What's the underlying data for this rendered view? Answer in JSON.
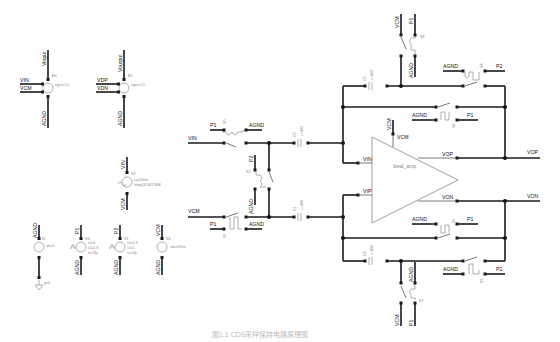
{
  "caption": "图1.1  CDS采样保持电路原理图",
  "sources": {
    "e0": {
      "name": "E0",
      "param": "egain:1.0",
      "top": "Vinput",
      "in_p": "VIN",
      "in_n": "VCM",
      "bottom": "AGND"
    },
    "e1": {
      "name": "E1",
      "param": "egain:1.0",
      "top": "Voutput",
      "in_p": "VDP",
      "in_n": "VDN",
      "bottom": "AGND"
    },
    "v5": {
      "name": "V5",
      "param1": "vo=500m",
      "param2": "freq=(31/64)*48M",
      "top": "VIN",
      "bottom": "VCM"
    },
    "i0": {
      "name": "I0",
      "param": "idc=0",
      "top": "AGND",
      "bottom": "gnd"
    },
    "v3": {
      "name": "V3",
      "param1": "v1=0",
      "param2": "v2=1.8",
      "param3": "tr=18p",
      "top": "P1",
      "bottom": "AGND"
    },
    "v1": {
      "name": "V1",
      "param1": "v1=1.8",
      "param2": "v2=0",
      "param3": "tr=10p",
      "top": "P2",
      "bottom": "AGND"
    },
    "v4": {
      "name": "V4",
      "param": "vdc=900m",
      "top": "VCM",
      "bottom": "AGND"
    }
  },
  "input_stage": {
    "vin": "VIN",
    "vcm": "VCM",
    "p1_top": "P1",
    "agnd_top": "AGND",
    "p1_bottom": "P1",
    "agnd_bottom": "AGND",
    "p2": "P2",
    "agnd_mid": "AGND",
    "sw_top": "S0",
    "sw_mid": "S2",
    "sw_bottom": "S1",
    "c_top": {
      "name": "C0",
      "value": "c=400f"
    },
    "c_bottom": {
      "name": "C1",
      "value": "c=400f"
    }
  },
  "opamp": {
    "name": "ideal_amp",
    "in_n": "VIN",
    "in_p": "VIP",
    "out_p": "VOP",
    "out_n": "VON",
    "vcm_pin": "VCM",
    "vcm_label": "VCM"
  },
  "feedback_top": {
    "vcm": "VCM",
    "p1": "P1",
    "sw_vcm": "S6",
    "agnd_vert": "AGND",
    "cap": {
      "name": "C2",
      "value": "c=200f"
    },
    "agnd_p2": "AGND",
    "p2": "P2",
    "sw_p2": "S8",
    "agnd_p1": "AGND",
    "p1_reset": "P1",
    "sw_reset": "S4"
  },
  "feedback_bottom": {
    "vcm": "VCM",
    "p1": "P1",
    "sw_vcm": "S7",
    "agnd_vert": "AGND",
    "cap": {
      "name": "C3",
      "value": "c=200f"
    },
    "agnd_p2": "AGND",
    "p2": "P2",
    "sw_p2": "S9",
    "agnd_p1": "AGND",
    "p1_reset": "P1",
    "sw_reset": "S5"
  },
  "outputs": {
    "vop": "VOP",
    "von": "VON"
  }
}
